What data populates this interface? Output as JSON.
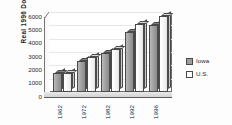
{
  "chart_data": {
    "type": "bar",
    "title": "",
    "subtitle": "",
    "xlabel": "",
    "ylabel": "Real 1996 Dollars",
    "categories": [
      "1962",
      "1972",
      "1982",
      "1992",
      "1996"
    ],
    "series": [
      {
        "name": "Iowa",
        "values": [
          1400,
          2300,
          2900,
          4500,
          5000
        ],
        "color": "#9e9e9e"
      },
      {
        "name": "U.S.",
        "values": [
          1400,
          2600,
          3200,
          5100,
          5700
        ],
        "color": "#ffffff"
      }
    ],
    "ylim": [
      0,
      6000
    ],
    "yticks": [
      "0",
      "1000",
      "2000",
      "3000",
      "4000",
      "5000",
      "6000"
    ],
    "ytick_values": [
      0,
      1000,
      2000,
      3000,
      4000,
      5000,
      6000
    ],
    "grid": false,
    "legend_position": "right",
    "style": "3d-column"
  },
  "axis": {
    "y_title": "Real 1996 Dollars",
    "y_ticks": [
      "6000",
      "5000",
      "4000",
      "3000",
      "2000",
      "1000",
      "0"
    ],
    "x_ticks": [
      "1962",
      "1972",
      "1982",
      "1992",
      "1996"
    ]
  },
  "legend": {
    "items": [
      {
        "label": "Iowa",
        "swatch": "legend-swatch-iowa"
      },
      {
        "label": "U.S.",
        "swatch": "legend-swatch-us"
      }
    ]
  }
}
